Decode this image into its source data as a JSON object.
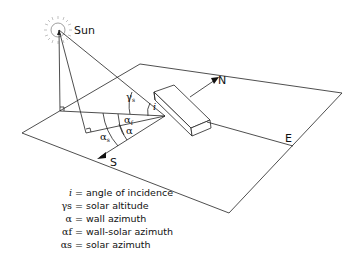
{
  "diagram": {
    "labels": {
      "sun": "Sun",
      "north": "N",
      "south": "S",
      "east": "E",
      "incidence_symbol": "i",
      "altitude_symbol": "γs",
      "wall_azimuth_symbol": "α",
      "wall_solar_azimuth_symbol": "αf",
      "solar_azimuth_symbol": "αs"
    },
    "legend": [
      {
        "symbol": "i",
        "eq": " = ",
        "text": "angle of incidence"
      },
      {
        "symbol": "γs",
        "eq": " = ",
        "text": "solar altitude"
      },
      {
        "symbol": "α",
        "eq": " = ",
        "text": "wall azimuth"
      },
      {
        "symbol": "αf",
        "eq": " = ",
        "text": "wall-solar azimuth"
      },
      {
        "symbol": "αs",
        "eq": " = ",
        "text": "solar azimuth"
      }
    ]
  }
}
